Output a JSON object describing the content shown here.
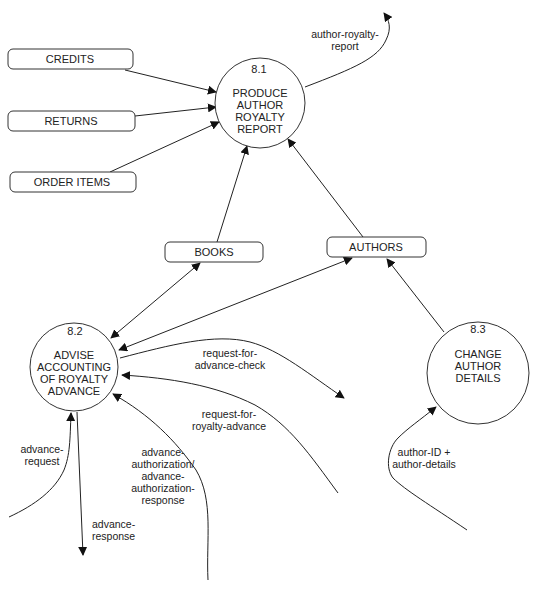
{
  "diagram": {
    "type": "data-flow-diagram",
    "processes": [
      {
        "id": "8.1",
        "number": "8.1",
        "lines": [
          "PRODUCE",
          "AUTHOR",
          "ROYALTY",
          "REPORT"
        ]
      },
      {
        "id": "8.2",
        "number": "8.2",
        "lines": [
          "ADVISE",
          "ACCOUNTING",
          "OF ROYALTY",
          "ADVANCE"
        ]
      },
      {
        "id": "8.3",
        "number": "8.3",
        "lines": [
          "CHANGE",
          "AUTHOR",
          "DETAILS"
        ]
      }
    ],
    "data_stores": [
      {
        "id": "credits",
        "label": "CREDITS"
      },
      {
        "id": "returns",
        "label": "RETURNS"
      },
      {
        "id": "order_items",
        "label": "ORDER ITEMS"
      },
      {
        "id": "books",
        "label": "BOOKS"
      },
      {
        "id": "authors",
        "label": "AUTHORS"
      }
    ],
    "flows": [
      {
        "from": "CREDITS",
        "to": "8.1",
        "label": ""
      },
      {
        "from": "RETURNS",
        "to": "8.1",
        "label": ""
      },
      {
        "from": "ORDER ITEMS",
        "to": "8.1",
        "label": ""
      },
      {
        "from": "BOOKS",
        "to": "8.1",
        "label": ""
      },
      {
        "from": "AUTHORS",
        "to": "8.1",
        "label": ""
      },
      {
        "from": "8.1",
        "to": "external",
        "label_lines": [
          "author-royalty-",
          "report"
        ]
      },
      {
        "from": "8.2",
        "to": "BOOKS",
        "label": "",
        "bidirectional": true
      },
      {
        "from": "8.2",
        "to": "AUTHORS",
        "label": "",
        "bidirectional": true
      },
      {
        "from": "8.3",
        "to": "AUTHORS",
        "label": ""
      },
      {
        "from": "8.2",
        "to": "external",
        "label_lines": [
          "request-for-",
          "advance-check"
        ]
      },
      {
        "from": "external",
        "to": "8.2",
        "label_lines": [
          "request-for-",
          "royalty-advance"
        ]
      },
      {
        "from": "external",
        "to": "8.2",
        "label_lines": [
          "advance-",
          "authorization/",
          "advance-",
          "authorization-",
          "response"
        ]
      },
      {
        "from": "external",
        "to": "8.2",
        "label_lines": [
          "advance-",
          "request"
        ]
      },
      {
        "from": "8.2",
        "to": "external",
        "label_lines": [
          "advance-",
          "response"
        ]
      },
      {
        "from": "external",
        "to": "8.3",
        "label_lines": [
          "author-ID +",
          "author-details"
        ]
      }
    ]
  }
}
